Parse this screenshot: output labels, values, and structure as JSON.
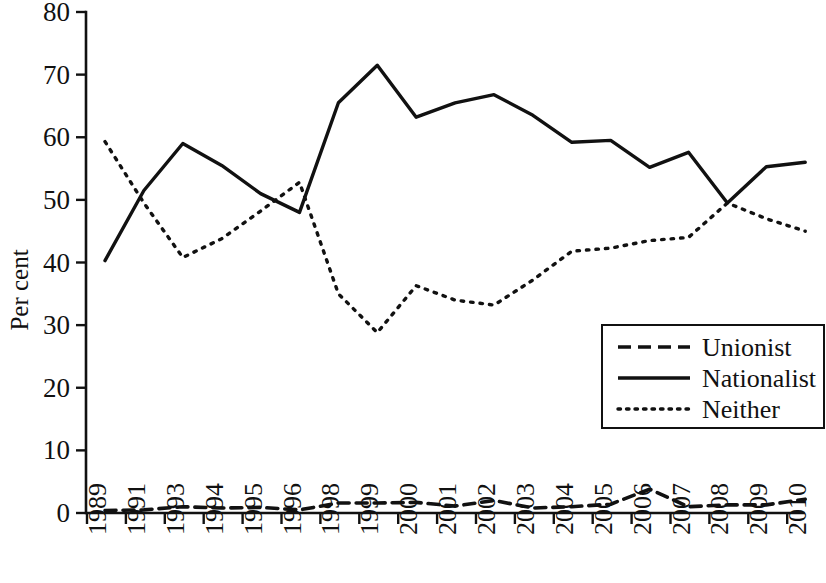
{
  "chart_data": {
    "type": "line",
    "title": "",
    "xlabel": "",
    "ylabel": "Per cent",
    "ylim": [
      0,
      80
    ],
    "ytick_step": 10,
    "grid": false,
    "legend_position": "inside-right-lower",
    "categories": [
      "1989",
      "1991",
      "1993",
      "1994",
      "1995",
      "1996",
      "1998",
      "1999",
      "2000",
      "2001",
      "2002",
      "2003",
      "2004",
      "2005",
      "2006",
      "2007",
      "2008",
      "2009",
      "2010"
    ],
    "yticks": [
      "0",
      "10",
      "20",
      "30",
      "40",
      "50",
      "60",
      "70",
      "80"
    ],
    "series": [
      {
        "name": "Unionist",
        "style": "dashed",
        "color": "#111111",
        "values": [
          0.4,
          0.5,
          1.0,
          0.8,
          0.9,
          0.5,
          1.6,
          1.6,
          1.7,
          1.1,
          2.0,
          0.8,
          1.0,
          1.4,
          3.8,
          1.0,
          1.3,
          1.3,
          2.2
        ]
      },
      {
        "name": "Nationalist",
        "style": "solid",
        "color": "#111111",
        "values": [
          40.3,
          51.5,
          59.0,
          55.5,
          51.0,
          48.0,
          65.5,
          71.5,
          63.2,
          65.5,
          66.8,
          63.5,
          59.2,
          59.5,
          55.2,
          57.6,
          49.5,
          55.3,
          56.0
        ]
      },
      {
        "name": "Neither",
        "style": "dotted",
        "color": "#111111",
        "values": [
          59.3,
          49.5,
          40.8,
          43.8,
          48.2,
          52.8,
          35.0,
          28.8,
          36.3,
          34.0,
          33.2,
          37.2,
          41.8,
          42.3,
          43.5,
          44.0,
          49.5,
          47.0,
          45.0
        ]
      }
    ]
  },
  "legend": {
    "items": [
      {
        "label": "Unionist",
        "style": "dashed"
      },
      {
        "label": "Nationalist",
        "style": "solid"
      },
      {
        "label": "Neither",
        "style": "dotted"
      }
    ]
  },
  "axes": {
    "y_title": "Per cent"
  }
}
